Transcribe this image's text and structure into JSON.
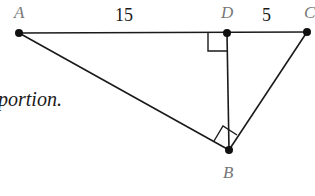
{
  "diagram": {
    "points": {
      "A": {
        "label": "A",
        "x": 19,
        "y": 33
      },
      "D": {
        "label": "D",
        "x": 227,
        "y": 33
      },
      "C": {
        "label": "C",
        "x": 307,
        "y": 32
      },
      "B": {
        "label": "B",
        "x": 229,
        "y": 150
      }
    },
    "segments": [
      "AC",
      "AB",
      "BC",
      "DB"
    ],
    "lengths": {
      "AD": "15",
      "DC": "5"
    },
    "right_angles": [
      "ADB",
      "ABC"
    ],
    "caption_fragment": "portion."
  },
  "colors": {
    "line": "#1a1a1a",
    "point_label": "#777777"
  }
}
